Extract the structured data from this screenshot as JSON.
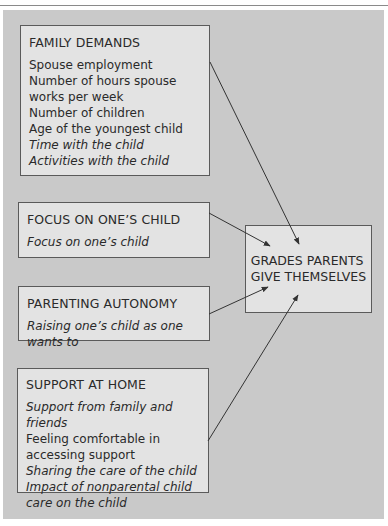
{
  "diagram": {
    "boxes": {
      "family_demands": {
        "title": "FAMILY DEMANDS",
        "items": [
          {
            "text": "Spouse employment",
            "italic": false
          },
          {
            "text": "Number of hours spouse works per week",
            "italic": false
          },
          {
            "text": "Number of children",
            "italic": false
          },
          {
            "text": "Age of the youngest child",
            "italic": false
          },
          {
            "text": "Time with the child",
            "italic": true
          },
          {
            "text": "Activities with the child",
            "italic": true
          }
        ]
      },
      "focus": {
        "title": "FOCUS ON ONE’S CHILD",
        "items": [
          {
            "text": "Focus on one’s child",
            "italic": true
          }
        ]
      },
      "autonomy": {
        "title": "PARENTING AUTONOMY",
        "items": [
          {
            "text": "Raising one’s child as one wants to",
            "italic": true
          }
        ]
      },
      "support": {
        "title": "SUPPORT AT HOME",
        "items": [
          {
            "text": "Support from family and friends",
            "italic": true
          },
          {
            "text": "Feeling comfortable in accessing support",
            "italic": false
          },
          {
            "text": "Sharing the care of the child",
            "italic": true
          },
          {
            "text": "Impact of nonparental child care on the child",
            "italic": true
          }
        ]
      },
      "outcome": {
        "line1": "GRADES PARENTS",
        "line2": "GIVE THEMSELVES"
      }
    },
    "edges": [
      {
        "from": "family_demands",
        "to": "outcome"
      },
      {
        "from": "focus",
        "to": "outcome"
      },
      {
        "from": "autonomy",
        "to": "outcome"
      },
      {
        "from": "support",
        "to": "outcome"
      }
    ],
    "colors": {
      "panel": "#c9c9c9",
      "box_fill": "#e3e3e3",
      "border": "#5a5a5a",
      "arrow": "#333333"
    }
  }
}
